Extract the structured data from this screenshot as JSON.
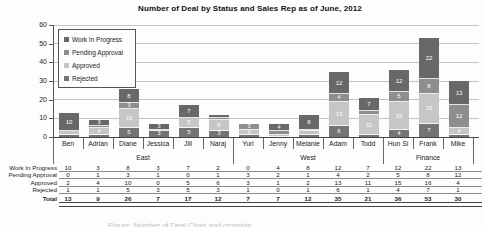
{
  "title": "Number of Deal by Status and Sales Rep as of June, 2012",
  "legend": [
    "Work In Progress",
    "Pending Approval",
    "Approved",
    "Rejected"
  ],
  "colors": {
    "Work In Progress": "#686868",
    "Pending Approval": "#8e8e8e",
    "Approved": "#c6c6c6",
    "Rejected": "#747474",
    "gridline": "#c4c4c4",
    "axis": "#444444",
    "background": "#fdfdfd"
  },
  "chart_data": {
    "type": "bar",
    "stacked": true,
    "title": "Number of Deal by Status and Sales Rep as of June, 2012",
    "categories": [
      "Ben",
      "Adrian",
      "Diane",
      "Jessica",
      "Jill",
      "Naraj",
      "Yuri",
      "Jenny",
      "Melanie",
      "Adam",
      "Todd",
      "Hun Si",
      "Frank",
      "Mike"
    ],
    "groups": [
      {
        "label": "East",
        "reps": 6
      },
      {
        "label": "West",
        "reps": 5
      },
      {
        "label": "Finance",
        "reps": 3
      }
    ],
    "series": [
      {
        "name": "Work In Progress",
        "values": [
          10,
          3,
          8,
          3,
          7,
          2,
          0,
          4,
          8,
          12,
          7,
          12,
          22,
          13
        ]
      },
      {
        "name": "Pending Approval",
        "values": [
          0,
          1,
          3,
          1,
          0,
          1,
          3,
          2,
          1,
          4,
          2,
          5,
          8,
          12
        ]
      },
      {
        "name": "Approved",
        "values": [
          2,
          4,
          10,
          0,
          5,
          6,
          3,
          1,
          2,
          13,
          11,
          15,
          16,
          4
        ]
      },
      {
        "name": "Rejected",
        "values": [
          1,
          1,
          5,
          3,
          5,
          3,
          1,
          0,
          1,
          6,
          1,
          4,
          7,
          1
        ]
      }
    ],
    "stack_order_bottom_to_top": [
      "Rejected",
      "Approved",
      "Pending Approval",
      "Work In Progress"
    ],
    "totals": [
      13,
      9,
      26,
      7,
      17,
      12,
      7,
      7,
      12,
      35,
      21,
      36,
      53,
      30
    ],
    "ylim": [
      0,
      60
    ],
    "yticks": [
      0,
      10,
      20,
      30,
      40,
      50,
      60
    ],
    "grid": true,
    "legend_position": "top-left-inside"
  },
  "table": {
    "rows": [
      {
        "label": "Work In Progress",
        "bold": false,
        "values": [
          10,
          3,
          8,
          3,
          7,
          2,
          0,
          4,
          8,
          12,
          7,
          12,
          22,
          13
        ]
      },
      {
        "label": "Pending Approval",
        "bold": false,
        "values": [
          0,
          1,
          3,
          1,
          0,
          1,
          3,
          2,
          1,
          4,
          2,
          5,
          8,
          12
        ]
      },
      {
        "label": "Approved",
        "bold": false,
        "values": [
          2,
          4,
          10,
          0,
          5,
          6,
          3,
          1,
          2,
          13,
          11,
          15,
          16,
          4
        ]
      },
      {
        "label": "Rejected",
        "bold": false,
        "values": [
          1,
          1,
          5,
          3,
          5,
          3,
          1,
          0,
          1,
          6,
          1,
          4,
          7,
          1
        ]
      },
      {
        "label": "Total",
        "bold": true,
        "values": [
          13,
          9,
          26,
          7,
          17,
          12,
          7,
          7,
          12,
          35,
          21,
          36,
          53,
          30
        ]
      }
    ]
  },
  "bottom_caption": "Figure: Number of Deal Chart and crosstab"
}
